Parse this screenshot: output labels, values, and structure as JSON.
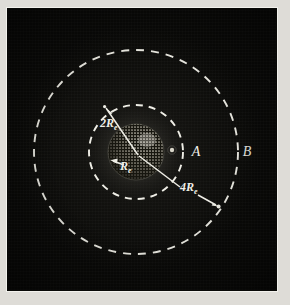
{
  "figure": {
    "kind": "astronomical-diagram",
    "medium": "halftone photographic plate",
    "background_color": "#0a0a08",
    "ink_color": "#f0efe8",
    "border_color": "#f2f1ec",
    "paper_color": "#dedcd7"
  },
  "body": {
    "name": "earth-sphere",
    "center": {
      "x": 136,
      "y": 152
    },
    "radius": 28,
    "shading": "stippled, illuminated from upper right"
  },
  "orbits": [
    {
      "id": "A",
      "label": "A",
      "label_position": {
        "x": 196,
        "y": 151
      },
      "radius": 47,
      "radius_label": "2R",
      "radius_label_subscript": "e",
      "style": "dashed",
      "radius_in_earth_radii": 2
    },
    {
      "id": "B",
      "label": "B",
      "label_position": {
        "x": 247,
        "y": 151
      },
      "radius": 102,
      "radius_label": "4R",
      "radius_label_subscript": "e",
      "style": "dashed",
      "radius_in_earth_radii": 4
    }
  ],
  "annotations": [
    {
      "id": "earth-radius",
      "text": "R",
      "subscript": "e",
      "position": {
        "x": 118,
        "y": 160
      },
      "arrow": "points left toward the sphere's limb",
      "leader": "radius line across the sphere"
    },
    {
      "id": "orbit-a-radius",
      "text": "2R",
      "subscript": "e",
      "position": {
        "x": 104,
        "y": 120
      },
      "arrow": "points up-left to circle A",
      "leader": "line from sphere centre to circle A"
    },
    {
      "id": "orbit-b-radius",
      "text": "4R",
      "subscript": "e",
      "position": {
        "x": 186,
        "y": 186
      },
      "arrow": "points down-right to circle B",
      "leader": "line from sphere centre to circle B"
    }
  ],
  "markers": [
    {
      "id": "satellite-dot",
      "position": {
        "x": 172,
        "y": 150
      },
      "radius": 2.2
    },
    {
      "id": "orbit-a-tip",
      "position": {
        "x": 104,
        "y": 106
      },
      "radius": 1.6
    },
    {
      "id": "orbit-b-tip",
      "position": {
        "x": 217,
        "y": 204
      },
      "radius": 2.0
    }
  ]
}
